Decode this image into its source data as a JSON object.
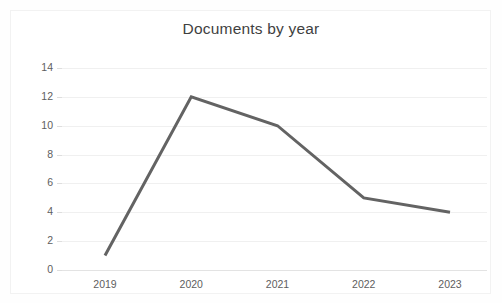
{
  "chart_data": {
    "type": "line",
    "title": "Documents by year",
    "xlabel": "",
    "ylabel": "",
    "categories": [
      "2019",
      "2020",
      "2021",
      "2022",
      "2023"
    ],
    "values": [
      1,
      12,
      10,
      5,
      4
    ],
    "series": [
      {
        "name": "Documents",
        "values": [
          1,
          12,
          10,
          5,
          4
        ],
        "color": "#636363"
      }
    ],
    "ylim": [
      0,
      14
    ],
    "yticks": [
      0,
      2,
      4,
      6,
      8,
      10,
      12,
      14
    ],
    "ytick_labels": [
      "0",
      "2",
      "4",
      "6",
      "8",
      "10",
      "12",
      "14"
    ],
    "xtick_labels": [
      "2019",
      "2020",
      "2021",
      "2022",
      "2023"
    ],
    "grid": "horizontal",
    "legend": "none",
    "annotations": []
  },
  "colors": {
    "line": "#636363",
    "title_text": "#3f3f3f",
    "tick_text": "#5e5e5e",
    "gridline": "#f0f0f0",
    "frame_border": "#f2f2f2",
    "background": "#ffffff"
  }
}
